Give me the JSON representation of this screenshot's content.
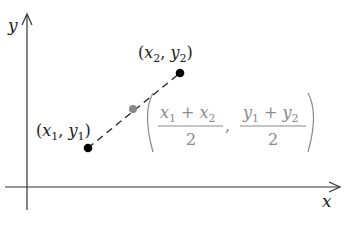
{
  "diagram": {
    "axes": {
      "x_label": "x",
      "y_label": "y",
      "color": "#333333"
    },
    "points": [
      {
        "name": "p1",
        "label_open": "(",
        "label_x": "x",
        "label_x_sub": "1",
        "label_sep": ", ",
        "label_y": "y",
        "label_y_sub": "1",
        "label_close": ")",
        "px": 88,
        "py": 148,
        "color": "#000000"
      },
      {
        "name": "p2",
        "label_open": "(",
        "label_x": "x",
        "label_x_sub": "2",
        "label_sep": ", ",
        "label_y": "y",
        "label_y_sub": "2",
        "label_close": ")",
        "px": 180,
        "py": 73,
        "color": "#000000"
      }
    ],
    "midpoint": {
      "px": 133,
      "py": 109,
      "color": "#8a8a8a",
      "x_numerator_a": "x",
      "x_numerator_a_sub": "1",
      "x_numerator_op": "+",
      "x_numerator_b": "x",
      "x_numerator_b_sub": "2",
      "x_denominator": "2",
      "y_numerator_a": "y",
      "y_numerator_a_sub": "1",
      "y_numerator_op": "+",
      "y_numerator_b": "y",
      "y_numerator_b_sub": "2",
      "y_denominator": "2",
      "separator": ","
    },
    "segment_style": "dashed"
  }
}
